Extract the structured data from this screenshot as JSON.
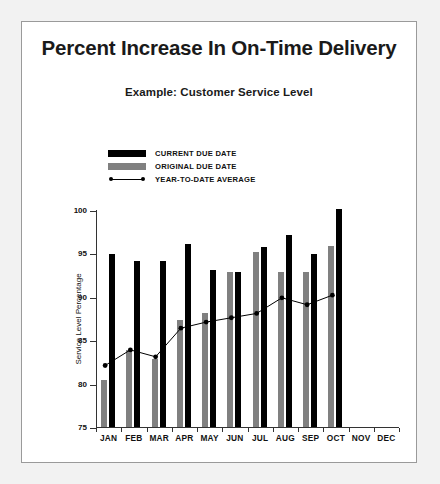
{
  "slide": {
    "title": "Percent Increase In On-Time Delivery",
    "subtitle": "Example:  Customer Service Level"
  },
  "legend": {
    "items": [
      {
        "label": "CURRENT DUE DATE",
        "swatch": "black-bar-swatch",
        "color": "#000000"
      },
      {
        "label": "ORIGINAL DUE DATE",
        "swatch": "gray-bar-swatch",
        "color": "#808080"
      },
      {
        "label": "YEAR-TO-DATE AVERAGE",
        "swatch": "line-marker-swatch",
        "color": "#000000"
      }
    ]
  },
  "chart_data": {
    "type": "bar",
    "title": "Percent Increase In On-Time Delivery",
    "subtitle": "Example:  Customer Service Level",
    "xlabel": "",
    "ylabel": "Service Level Percentage",
    "ylim": [
      75,
      100
    ],
    "yticks": [
      75,
      80,
      85,
      90,
      95,
      100
    ],
    "ytick_labels": [
      "75",
      "80",
      "85",
      "90",
      "95",
      "100"
    ],
    "grid": false,
    "legend_position": "above-plot-left",
    "categories": [
      "JAN",
      "FEB",
      "MAR",
      "APR",
      "MAY",
      "JUN",
      "JUL",
      "AUG",
      "SEP",
      "OCT",
      "NOV",
      "DEC"
    ],
    "series": [
      {
        "name": "ORIGINAL DUE DATE",
        "type": "bar",
        "color": "#808080",
        "values": [
          80.5,
          84.0,
          83.0,
          87.5,
          88.2,
          93.0,
          95.3,
          93.0,
          93.0,
          96.0,
          null,
          null
        ]
      },
      {
        "name": "CURRENT DUE DATE",
        "type": "bar",
        "color": "#000000",
        "values": [
          95.0,
          94.2,
          94.2,
          96.2,
          93.2,
          93.0,
          95.8,
          97.2,
          95.0,
          100.2,
          null,
          null
        ]
      },
      {
        "name": "YEAR-TO-DATE AVERAGE",
        "type": "line",
        "color": "#000000",
        "marker": "filled-circle",
        "values": [
          82.2,
          84.0,
          83.2,
          86.5,
          87.2,
          87.7,
          88.2,
          90.0,
          89.2,
          90.3,
          null,
          null
        ]
      }
    ]
  }
}
